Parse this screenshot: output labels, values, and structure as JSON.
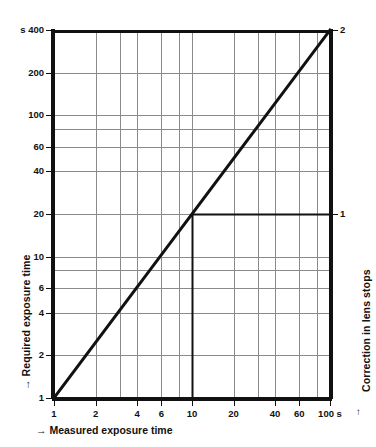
{
  "chart_data": {
    "type": "line",
    "title": "",
    "xlabel": "→ Measured exposure time",
    "ylabel": "→ Required exposure time",
    "y2label": "Correction in lens stops",
    "xscale": "log",
    "yscale": "log",
    "xlim": [
      1,
      100
    ],
    "ylim": [
      1,
      400
    ],
    "grid": true,
    "legend": null,
    "x_unit_suffix": "s",
    "y_unit_prefix": "s",
    "xticks": [
      {
        "value": 1,
        "label": "1"
      },
      {
        "value": 2,
        "label": "2"
      },
      {
        "value": 4,
        "label": "4"
      },
      {
        "value": 6,
        "label": "6"
      },
      {
        "value": 10,
        "label": "10"
      },
      {
        "value": 20,
        "label": "20"
      },
      {
        "value": 40,
        "label": "40"
      },
      {
        "value": 60,
        "label": "60"
      },
      {
        "value": 100,
        "label": "100 s"
      }
    ],
    "x_gridlines": [
      1,
      2,
      3,
      4,
      6,
      8,
      10,
      20,
      30,
      40,
      60,
      80,
      100
    ],
    "yticks": [
      {
        "value": 400,
        "label": "s 400"
      },
      {
        "value": 200,
        "label": "200"
      },
      {
        "value": 100,
        "label": "100"
      },
      {
        "value": 60,
        "label": "60"
      },
      {
        "value": 40,
        "label": "40"
      },
      {
        "value": 20,
        "label": "20"
      },
      {
        "value": 10,
        "label": "10"
      },
      {
        "value": 6,
        "label": "6"
      },
      {
        "value": 4,
        "label": "4"
      },
      {
        "value": 2,
        "label": "2"
      },
      {
        "value": 1,
        "label": "1"
      }
    ],
    "y_gridlines": [
      2,
      4,
      6,
      8,
      10,
      20,
      40,
      60,
      80,
      100,
      200,
      400
    ],
    "y2ticks": [
      {
        "value": 20,
        "label": "1"
      },
      {
        "value": 400,
        "label": "2"
      }
    ],
    "series": [
      {
        "name": "reciprocity-correction-curve",
        "points": [
          [
            1,
            1
          ],
          [
            100,
            400
          ]
        ],
        "style": "solid",
        "width": 3,
        "color": "#111111"
      }
    ],
    "annotations": [
      {
        "name": "construction-lines",
        "x": 10,
        "y": 20,
        "vertical_from_y": 1,
        "horizontal_to_x": 100,
        "color": "#111111",
        "width": 2
      }
    ]
  },
  "labels": {
    "x_axis_name": "→ Measured exposure time",
    "y_axis_name": "→ Required exposure time",
    "y2_axis_name": "Correction in lens stops",
    "y2_arrow": "↑",
    "x_arrow": "→",
    "y_arrow": "→"
  },
  "colors": {
    "background": "#ffffff",
    "frame": "#111111",
    "gridline": "#8a8a8a",
    "curve": "#111111",
    "text": "#111111"
  }
}
